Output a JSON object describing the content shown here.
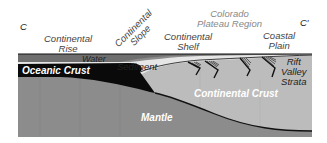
{
  "diagram": {
    "corner_left": "C",
    "corner_right": "C′",
    "labels": {
      "continental_rise": [
        "Continental",
        "Rise"
      ],
      "continental_slope": [
        "Continental",
        "Slope"
      ],
      "continental_shelf": [
        "Continental",
        "Shelf"
      ],
      "colorado_plateau": [
        "Colorado",
        "Plateau Region"
      ],
      "coastal_plain": [
        "Coastal",
        "Plain"
      ],
      "water": "Water",
      "sediment": "Sediment",
      "oceanic_crust": "Oceanic Crust",
      "rift_valley_strata": [
        "Rift",
        "Valley",
        "Strata"
      ],
      "continental_crust": "Continental Crust",
      "mantle": "Mantle"
    },
    "colors": {
      "water": "#6e6e6e",
      "oceanic_crust": "#0a0a0a",
      "sediment": "#e6e6e6",
      "continental_crust": "#bcbcbc",
      "mantle": "#8c8c8c",
      "outline": "#111111"
    }
  }
}
